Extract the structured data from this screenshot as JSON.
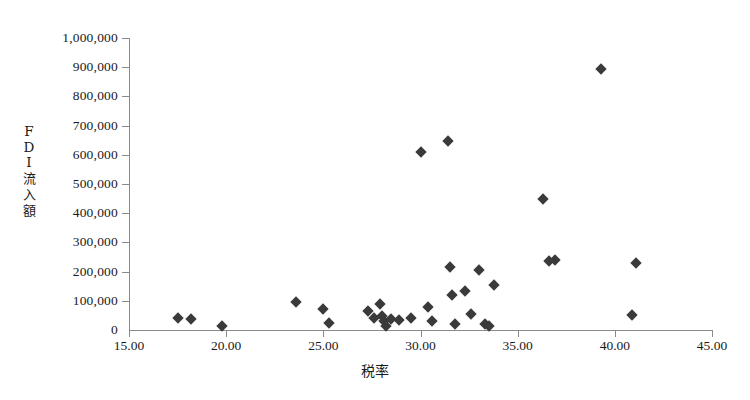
{
  "chart_data": {
    "type": "scatter",
    "title": "",
    "xlabel": "税率",
    "ylabel": "FDI流入額",
    "ylabel_chars": [
      "F",
      "D",
      "I",
      "流",
      "入",
      "額"
    ],
    "xlim": [
      15.0,
      45.0
    ],
    "ylim": [
      0,
      1000000
    ],
    "grid": false,
    "legend": false,
    "marker": "diamond",
    "marker_color": "#3a3a3a",
    "xticks": [
      15.0,
      20.0,
      25.0,
      30.0,
      35.0,
      40.0,
      45.0
    ],
    "xtick_labels": [
      "15.00",
      "20.00",
      "25.00",
      "30.00",
      "35.00",
      "40.00",
      "45.00"
    ],
    "yticks": [
      0,
      100000,
      200000,
      300000,
      400000,
      500000,
      600000,
      700000,
      800000,
      900000,
      1000000
    ],
    "ytick_labels": [
      "0",
      "100,000",
      "200,000",
      "300,000",
      "400,000",
      "500,000",
      "600,000",
      "700,000",
      "800,000",
      "900,000",
      "1,000,000"
    ],
    "points": [
      {
        "x": 17.5,
        "y": 40000
      },
      {
        "x": 18.2,
        "y": 38000
      },
      {
        "x": 19.8,
        "y": 15000
      },
      {
        "x": 23.6,
        "y": 95000
      },
      {
        "x": 25.0,
        "y": 72000
      },
      {
        "x": 25.3,
        "y": 25000
      },
      {
        "x": 27.3,
        "y": 65000
      },
      {
        "x": 27.6,
        "y": 40000
      },
      {
        "x": 27.9,
        "y": 90000
      },
      {
        "x": 28.0,
        "y": 48000
      },
      {
        "x": 28.1,
        "y": 30000
      },
      {
        "x": 28.2,
        "y": 12000
      },
      {
        "x": 28.5,
        "y": 38000
      },
      {
        "x": 28.9,
        "y": 35000
      },
      {
        "x": 29.5,
        "y": 40000
      },
      {
        "x": 30.0,
        "y": 610000
      },
      {
        "x": 30.4,
        "y": 78000
      },
      {
        "x": 30.6,
        "y": 30000
      },
      {
        "x": 31.4,
        "y": 648000
      },
      {
        "x": 31.5,
        "y": 215000
      },
      {
        "x": 31.6,
        "y": 120000
      },
      {
        "x": 31.8,
        "y": 20000
      },
      {
        "x": 32.3,
        "y": 135000
      },
      {
        "x": 32.6,
        "y": 55000
      },
      {
        "x": 33.0,
        "y": 205000
      },
      {
        "x": 33.3,
        "y": 20000
      },
      {
        "x": 33.5,
        "y": 15000
      },
      {
        "x": 33.8,
        "y": 155000
      },
      {
        "x": 36.3,
        "y": 450000
      },
      {
        "x": 36.6,
        "y": 238000
      },
      {
        "x": 36.9,
        "y": 240000
      },
      {
        "x": 39.3,
        "y": 893000
      },
      {
        "x": 40.9,
        "y": 52000
      },
      {
        "x": 41.1,
        "y": 228000
      }
    ]
  }
}
